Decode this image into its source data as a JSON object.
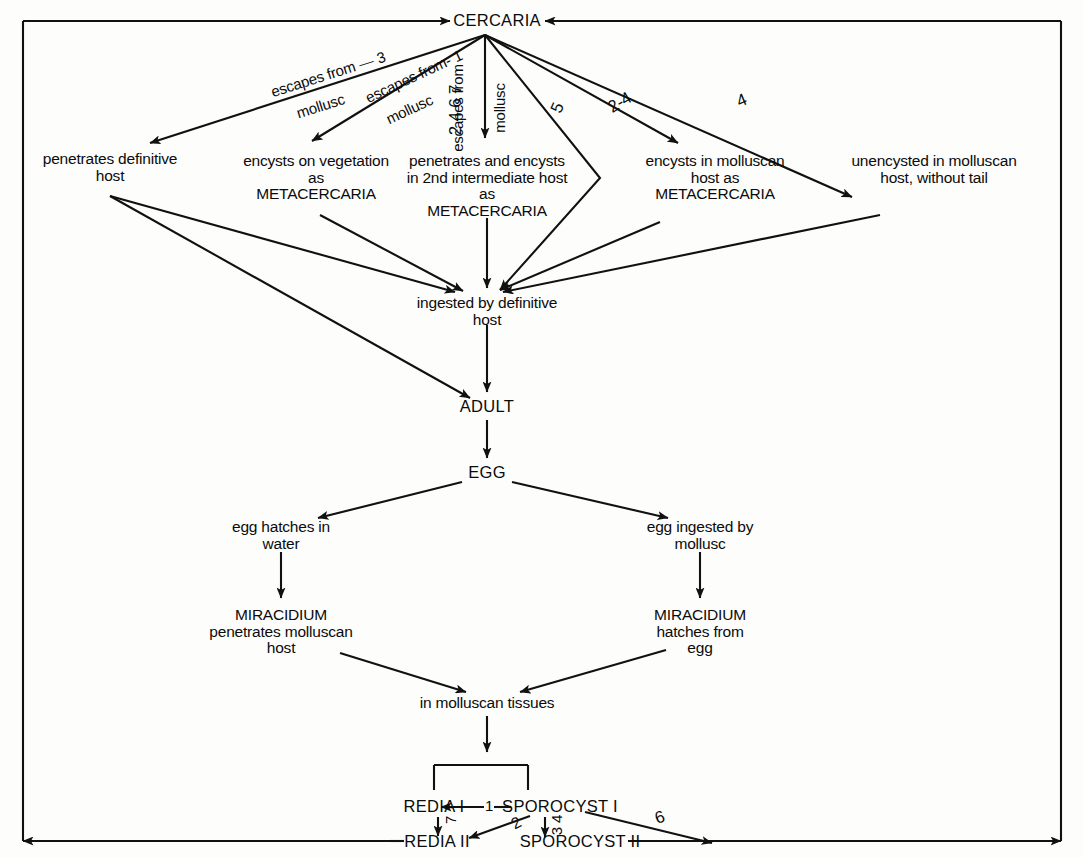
{
  "diagram": {
    "line_color": "#111111",
    "background_color": "#fdfdfc",
    "nodes": {
      "cercaria": "CERCARIA",
      "penetrates_definitive_host": "penetrates definitive\nhost",
      "encysts_on_vegetation": "encysts on vegetation\nas\nMETACERCARIA",
      "penetrates_2nd_intermediate": "penetrates and encysts\nin 2nd intermediate host\nas\nMETACERCARIA",
      "encysts_in_molluscan_host": "encysts in molluscan\nhost as\nMETACERCARIA",
      "unencysted_in_molluscan_host": "unencysted in molluscan\nhost, without tail",
      "ingested_by_definitive_host": "ingested by definitive\nhost",
      "adult": "ADULT",
      "egg": "EGG",
      "egg_hatches_in_water": "egg hatches in\nwater",
      "egg_ingested_by_mollusc": "egg ingested by\nmollusc",
      "miracidium_penetrates": "MIRACIDIUM\npenetrates molluscan\nhost",
      "miracidium_hatches": "MIRACIDIUM\nhatches from\negg",
      "in_molluscan_tissues": "in molluscan tissues",
      "redia_i": "REDIA I",
      "sporocyst_i": "SPOROCYST I",
      "redia_ii": "REDIA II",
      "sporocyst_ii": "SPOROCYST II"
    },
    "edge_labels": {
      "escapes_from_mollusc_3_text": "escapes from",
      "escapes_from_mollusc_3_sub": "mollusc",
      "escapes_from_mollusc_3_num": "3",
      "escapes_from_mollusc_1_text": "escapes from-",
      "escapes_from_mollusc_1_sub": "mollusc",
      "escapes_from_mollusc_1_num": "1",
      "escapes_from_mollusc_center_text": "escapes from",
      "escapes_from_mollusc_center_sub": "mollusc",
      "center_numbers": "2 4 6 7",
      "num_5": "5",
      "num_2_4": "2-4",
      "num_4": "4",
      "redia_sporocyst_link_num": "1",
      "redia_to_redia_ii_num": "7",
      "sporocyst_to_redia_ii_num": "2",
      "sporocyst_to_sporocyst_ii_num": "3 4",
      "sporocyst_to_outer_num": "6"
    }
  }
}
